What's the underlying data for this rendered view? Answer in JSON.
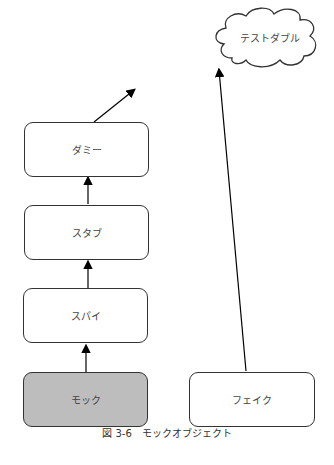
{
  "diagram": {
    "cloud": {
      "label": "テストダブル"
    },
    "nodes": {
      "dummy": {
        "label": "ダミー"
      },
      "stub": {
        "label": "スタブ"
      },
      "spy": {
        "label": "スパイ"
      },
      "mock": {
        "label": "モック",
        "fill": "#bdbdbd"
      },
      "fake": {
        "label": "フェイク"
      }
    },
    "edges": [
      {
        "from": "mock",
        "to": "spy"
      },
      {
        "from": "spy",
        "to": "stub"
      },
      {
        "from": "stub",
        "to": "dummy"
      },
      {
        "from": "dummy",
        "to": "cloud"
      },
      {
        "from": "fake",
        "to": "cloud"
      }
    ],
    "caption": "図 3-6　モックオブジェクト"
  }
}
